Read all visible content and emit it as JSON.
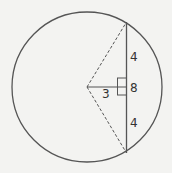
{
  "diagram": {
    "labels": {
      "upper_half": "4",
      "chord_length": "8",
      "lower_half": "4",
      "distance_to_center": "3"
    },
    "colors": {
      "stroke": "#555555",
      "background": "#f3f3f1"
    }
  }
}
